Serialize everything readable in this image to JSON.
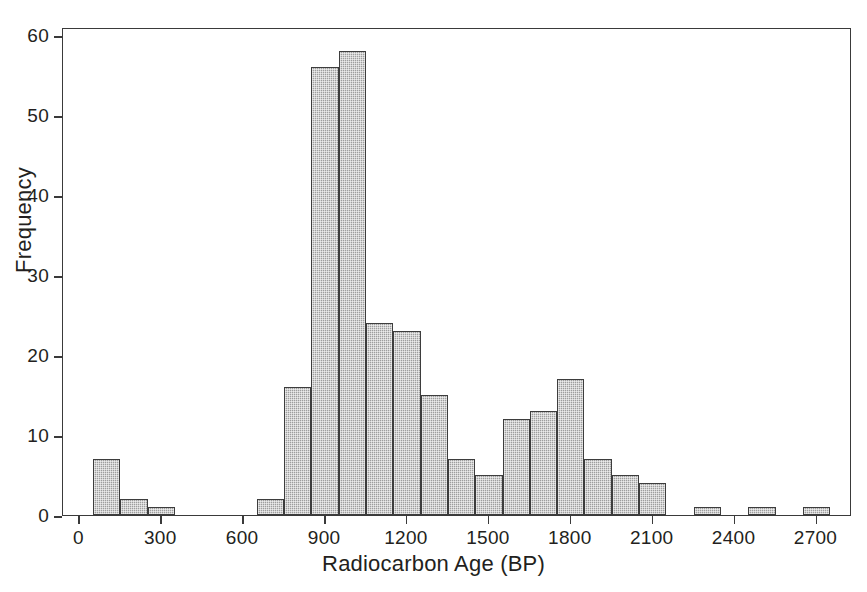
{
  "chart_data": {
    "type": "bar",
    "title": "",
    "subtitle": "",
    "xlabel": "Radiocarbon Age (BP)",
    "ylabel": "Frequency",
    "xlim": [
      -60,
      2830
    ],
    "ylim": [
      0,
      61
    ],
    "xticks": [
      0,
      300,
      600,
      900,
      1200,
      1500,
      1800,
      2100,
      2400,
      2700
    ],
    "xtick_labels": [
      "0",
      "300",
      "600",
      "900",
      "1200",
      "1500",
      "1800",
      "2100",
      "2400",
      "2700"
    ],
    "yticks": [
      0,
      10,
      20,
      30,
      40,
      50,
      60
    ],
    "ytick_labels": [
      "0",
      "10",
      "20",
      "30",
      "40",
      "50",
      "60"
    ],
    "grid": false,
    "legend": null,
    "bin_width": 100,
    "bins": [
      {
        "start": 50,
        "end": 150,
        "value": 7
      },
      {
        "start": 150,
        "end": 250,
        "value": 2
      },
      {
        "start": 250,
        "end": 350,
        "value": 1
      },
      {
        "start": 650,
        "end": 750,
        "value": 2
      },
      {
        "start": 750,
        "end": 850,
        "value": 16
      },
      {
        "start": 850,
        "end": 950,
        "value": 56
      },
      {
        "start": 950,
        "end": 1050,
        "value": 58
      },
      {
        "start": 1050,
        "end": 1150,
        "value": 24
      },
      {
        "start": 1150,
        "end": 1250,
        "value": 23
      },
      {
        "start": 1250,
        "end": 1350,
        "value": 15
      },
      {
        "start": 1350,
        "end": 1450,
        "value": 7
      },
      {
        "start": 1450,
        "end": 1550,
        "value": 5
      },
      {
        "start": 1550,
        "end": 1650,
        "value": 12
      },
      {
        "start": 1650,
        "end": 1750,
        "value": 13
      },
      {
        "start": 1750,
        "end": 1850,
        "value": 17
      },
      {
        "start": 1850,
        "end": 1950,
        "value": 7
      },
      {
        "start": 1950,
        "end": 2050,
        "value": 5
      },
      {
        "start": 2050,
        "end": 2150,
        "value": 4
      },
      {
        "start": 2250,
        "end": 2350,
        "value": 1
      },
      {
        "start": 2450,
        "end": 2550,
        "value": 1
      },
      {
        "start": 2650,
        "end": 2750,
        "value": 1
      }
    ],
    "categories": [
      "50-150",
      "150-250",
      "250-350",
      "650-750",
      "750-850",
      "850-950",
      "950-1050",
      "1050-1150",
      "1150-1250",
      "1250-1350",
      "1350-1450",
      "1450-1550",
      "1550-1650",
      "1650-1750",
      "1750-1850",
      "1850-1950",
      "1950-2050",
      "2050-2150",
      "2250-2350",
      "2450-2550",
      "2650-2750"
    ],
    "values": [
      7,
      2,
      1,
      2,
      16,
      56,
      58,
      24,
      23,
      15,
      7,
      5,
      12,
      13,
      17,
      7,
      5,
      4,
      1,
      1,
      1
    ]
  },
  "style": {
    "bar_fill": "#9e9e9e",
    "bar_edge": "#3d3d3d",
    "axis_color": "#3a3a3a",
    "text_color": "#231f20",
    "background": "#ffffff"
  }
}
